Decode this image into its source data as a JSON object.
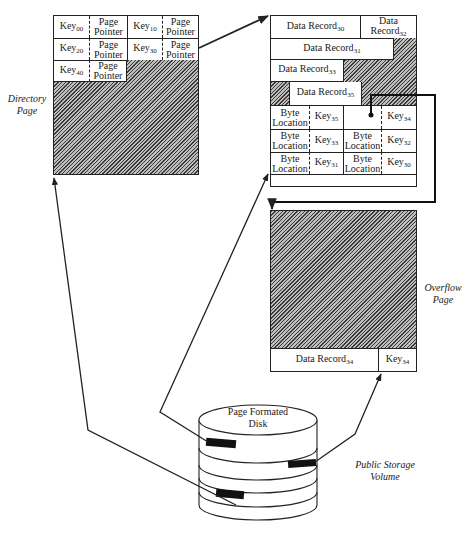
{
  "directory_page": {
    "label_line1": "Directory",
    "label_line2": "Page",
    "entries": [
      {
        "key": "Key",
        "key_sub": "00",
        "ptr1": "Page",
        "ptr2": "Pointer"
      },
      {
        "key": "Key",
        "key_sub": "10",
        "ptr1": "Page",
        "ptr2": "Pointer"
      },
      {
        "key": "Key",
        "key_sub": "20",
        "ptr1": "Page",
        "ptr2": "Pointer"
      },
      {
        "key": "Key",
        "key_sub": "30",
        "ptr1": "Page",
        "ptr2": "Pointer"
      },
      {
        "key": "Key",
        "key_sub": "40",
        "ptr1": "Page",
        "ptr2": "Pointer"
      }
    ]
  },
  "data_page": {
    "records": [
      {
        "name": "Data Record",
        "sub": "30"
      },
      {
        "name": "Data",
        "name2": "Record",
        "sub": "32"
      },
      {
        "name": "Data Record",
        "sub": "31"
      },
      {
        "name": "Data Record",
        "sub": "33"
      },
      {
        "name": "Data Record",
        "sub": "35"
      }
    ],
    "index": [
      {
        "loc1": "Byte",
        "loc2": "Location",
        "key": "Key",
        "sub": "35"
      },
      {
        "loc1": "",
        "loc2": "",
        "key": "Key",
        "sub": "34"
      },
      {
        "loc1": "Byte",
        "loc2": "Location",
        "key": "Key",
        "sub": "33"
      },
      {
        "loc1": "Byte",
        "loc2": "Location",
        "key": "Key",
        "sub": "32"
      },
      {
        "loc1": "Byte",
        "loc2": "Location",
        "key": "Key",
        "sub": "31"
      },
      {
        "loc1": "Byte",
        "loc2": "Location",
        "key": "Key",
        "sub": "30"
      }
    ]
  },
  "overflow_page": {
    "label_line1": "Overflow",
    "label_line2": "Page",
    "record": {
      "name": "Data Record",
      "sub": "34"
    },
    "key": {
      "name": "Key",
      "sub": "34"
    }
  },
  "disk": {
    "title_line1": "Page Formated",
    "title_line2": "Disk",
    "label_line1": "Public Storage",
    "label_line2": "Volume"
  }
}
